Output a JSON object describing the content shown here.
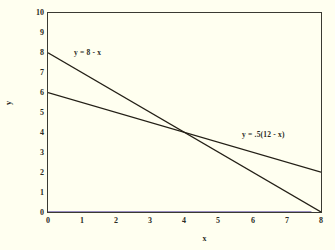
{
  "chart_data": {
    "type": "line",
    "title": "",
    "subtitle": "",
    "xlabel": "x",
    "ylabel": "y",
    "xlim": [
      0,
      8
    ],
    "ylim": [
      0,
      10
    ],
    "grid": false,
    "legend_position": "inline-annotation",
    "xticks": [
      "0",
      "1",
      "2",
      "3",
      "4",
      "5",
      "6",
      "7",
      "8"
    ],
    "yticks": [
      "0",
      "1",
      "2",
      "3",
      "4",
      "5",
      "6",
      "7",
      "8",
      "9",
      "10"
    ],
    "xtick_values": [
      0,
      1,
      2,
      3,
      4,
      5,
      6,
      7,
      8
    ],
    "ytick_values": [
      0,
      1,
      2,
      3,
      4,
      5,
      6,
      7,
      8,
      9,
      10
    ],
    "series": [
      {
        "name": "y = 8 - x",
        "label": "y = 8 - x",
        "color": "#231f16",
        "x": [
          0,
          8
        ],
        "values": [
          8,
          0
        ],
        "label_x": 1.15,
        "label_y": 7.45
      },
      {
        "name": "y = .5(12 - x)",
        "label": "y = .5(12 - x)",
        "color": "#231f16",
        "x": [
          0,
          8
        ],
        "values": [
          6,
          2
        ],
        "label_x": 5.35,
        "label_y": 3.62
      },
      {
        "name": "y = 0 baseline",
        "label": "",
        "color": "#9a8fc0",
        "x": [
          0,
          7.72
        ],
        "values": [
          0,
          0
        ],
        "label_x": null,
        "label_y": null
      }
    ],
    "annotations": [
      {
        "text": "y = 8 - x",
        "x": 1.15,
        "y": 7.45
      },
      {
        "text": "y = .5(12 - x)",
        "x": 5.35,
        "y": 3.62
      }
    ],
    "intersection": {
      "x": 4,
      "y": 4
    }
  },
  "axes": {
    "x_title": "x",
    "y_title": "y"
  },
  "colors": {
    "background": "#fffff0",
    "plot_border": "#3a3a32",
    "line": "#231f16",
    "baseline": "#9a8fc0",
    "text": "#2b2b24"
  }
}
